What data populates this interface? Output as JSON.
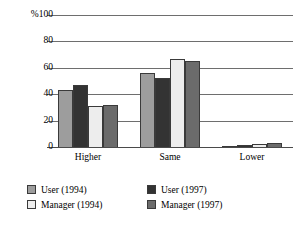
{
  "chart_data": {
    "type": "bar",
    "title": "",
    "subtitle": "",
    "xlabel": "",
    "ylabel": "%100",
    "categories": [
      "Higher",
      "Same",
      "Lower"
    ],
    "ylim": [
      0,
      100
    ],
    "yticks": [
      0,
      20,
      40,
      60,
      80,
      100
    ],
    "ytick_labels": [
      "0",
      "20",
      "40",
      "60",
      "80",
      "%100"
    ],
    "grid": true,
    "legend_position": "bottom-left",
    "series": [
      {
        "name": "User (1994)",
        "color": "#9d9d9d",
        "values": [
          43,
          56,
          1
        ]
      },
      {
        "name": "User (1997)",
        "color": "#333333",
        "values": [
          47,
          52,
          1.5
        ]
      },
      {
        "name": "Manager (1994)",
        "color": "#ededed",
        "values": [
          31,
          67,
          2
        ]
      },
      {
        "name": "Manager (1997)",
        "color": "#6b6b6b",
        "values": [
          32,
          65,
          3
        ]
      }
    ]
  },
  "axis": {
    "y_ticks": [
      {
        "label": "%100",
        "value": 100
      },
      {
        "label": "80",
        "value": 80
      },
      {
        "label": "60",
        "value": 60
      },
      {
        "label": "40",
        "value": 40
      },
      {
        "label": "20",
        "value": 20
      },
      {
        "label": "0",
        "value": 0
      }
    ],
    "x_ticks": [
      {
        "label": "Higher"
      },
      {
        "label": "Same"
      },
      {
        "label": "Lower"
      }
    ]
  },
  "legend": {
    "entries": [
      {
        "label": "User (1994)",
        "color": "#9d9d9d"
      },
      {
        "label": "User (1997)",
        "color": "#333333"
      },
      {
        "label": "Manager (1994)",
        "color": "#ededed"
      },
      {
        "label": "Manager (1997)",
        "color": "#6b6b6b"
      }
    ]
  }
}
